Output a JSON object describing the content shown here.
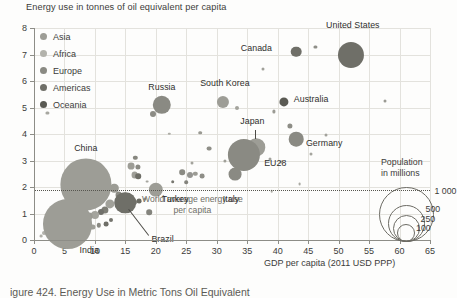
{
  "chart_data": {
    "type": "scatter",
    "title": "Energy use in tonnes of oil equivalent per capita",
    "xlabel": "GDP per capita (2011 USD PPP)",
    "ylabel": "Energy use in tonnes of oil equivalent per capita",
    "xlim": [
      0,
      65
    ],
    "ylim": [
      0,
      8
    ],
    "xticks": [
      "0",
      "5",
      "10",
      "15",
      "20",
      "25",
      "30",
      "35",
      "40",
      "45",
      "50",
      "55",
      "60",
      "65"
    ],
    "yticks": [
      "0",
      "1",
      "2",
      "3",
      "4",
      "5",
      "6",
      "7",
      "8"
    ],
    "grid": true,
    "legend_position": "top-left",
    "bubble_size_meaning": "Population in millions",
    "reference_line": {
      "value": 1.9,
      "label_line1": "World average energy use",
      "label_line2": "per capita",
      "style": "dotted"
    },
    "series": [
      {
        "name": "Asia",
        "color": "#9d9d96"
      },
      {
        "name": "Africa",
        "color": "#b3b3ac"
      },
      {
        "name": "Europe",
        "color": "#8a8a83"
      },
      {
        "name": "Americas",
        "color": "#6f6f68"
      },
      {
        "name": "Oceania",
        "color": "#5a5a53"
      }
    ],
    "size_legend": {
      "title_line1": "Population",
      "title_line2": "in millions",
      "entries": [
        "1 000",
        "500",
        "250",
        "100"
      ]
    },
    "annotated_points": [
      {
        "label": "United States",
        "x": 52,
        "y": 7.0,
        "pop": 320,
        "region": "Americas"
      },
      {
        "label": "Canada",
        "x": 43,
        "y": 7.1,
        "pop": 36,
        "region": "Americas"
      },
      {
        "label": "Russia",
        "x": 21,
        "y": 5.1,
        "pop": 144,
        "region": "Europe"
      },
      {
        "label": "South Korea",
        "x": 31,
        "y": 5.2,
        "pop": 51,
        "region": "Asia"
      },
      {
        "label": "Australia",
        "x": 41,
        "y": 5.2,
        "pop": 24,
        "region": "Oceania"
      },
      {
        "label": "Japan",
        "x": 36.5,
        "y": 3.5,
        "pop": 127,
        "region": "Asia"
      },
      {
        "label": "Germany",
        "x": 43,
        "y": 3.8,
        "pop": 82,
        "region": "Europe"
      },
      {
        "label": "EU28",
        "x": 34.5,
        "y": 3.2,
        "pop": 510,
        "region": "Europe"
      },
      {
        "label": "Italy",
        "x": 33,
        "y": 2.5,
        "pop": 60,
        "region": "Europe"
      },
      {
        "label": "China",
        "x": 8.5,
        "y": 2.1,
        "pop": 1380,
        "region": "Asia"
      },
      {
        "label": "India",
        "x": 5.5,
        "y": 0.6,
        "pop": 1310,
        "region": "Asia"
      },
      {
        "label": "Turkey",
        "x": 20,
        "y": 1.9,
        "pop": 79,
        "region": "Asia"
      },
      {
        "label": "Brazil",
        "x": 15,
        "y": 1.4,
        "pop": 208,
        "region": "Americas"
      }
    ],
    "other_points": [
      {
        "x": 2.2,
        "y": 4.8,
        "r": 1.6,
        "c": "#a7a7a0"
      },
      {
        "x": 27.3,
        "y": 4.05,
        "r": 1.8,
        "c": "#9a9a93"
      },
      {
        "x": 19.6,
        "y": 4.75,
        "r": 3.0,
        "c": "#8c8c85"
      },
      {
        "x": 22.2,
        "y": 4.0,
        "r": 1.2,
        "c": "#aeaea7"
      },
      {
        "x": 46.2,
        "y": 7.3,
        "r": 1.6,
        "c": "#8f8f88"
      },
      {
        "x": 37.6,
        "y": 6.45,
        "r": 1.5,
        "c": "#a0a099"
      },
      {
        "x": 57.6,
        "y": 5.25,
        "r": 1.5,
        "c": "#9a9a93"
      },
      {
        "x": 33.4,
        "y": 5.0,
        "r": 2.0,
        "c": "#a3a39c"
      },
      {
        "x": 39.4,
        "y": 4.85,
        "r": 1.6,
        "c": "#9b9b94"
      },
      {
        "x": 42.0,
        "y": 4.3,
        "r": 2.6,
        "c": "#8d8d86"
      },
      {
        "x": 48.0,
        "y": 3.95,
        "r": 1.5,
        "c": "#a2a29b"
      },
      {
        "x": 45.4,
        "y": 3.25,
        "r": 1.5,
        "c": "#a5a59e"
      },
      {
        "x": 40.6,
        "y": 2.95,
        "r": 1.4,
        "c": "#a8a8a1"
      },
      {
        "x": 38.7,
        "y": 3.05,
        "r": 1.5,
        "c": "#a2a29b"
      },
      {
        "x": 43.6,
        "y": 2.1,
        "r": 1.4,
        "c": "#aaaaa3"
      },
      {
        "x": 39.0,
        "y": 1.85,
        "r": 1.3,
        "c": "#acaca5"
      },
      {
        "x": 28.8,
        "y": 3.45,
        "r": 2.4,
        "c": "#8f8f88"
      },
      {
        "x": 31.4,
        "y": 3.0,
        "r": 1.6,
        "c": "#a0a099"
      },
      {
        "x": 26.0,
        "y": 2.9,
        "r": 1.5,
        "c": "#a3a39c"
      },
      {
        "x": 24.3,
        "y": 2.55,
        "r": 2.8,
        "c": "#8b8b84"
      },
      {
        "x": 25.6,
        "y": 2.45,
        "r": 3.0,
        "c": "#949490"
      },
      {
        "x": 26.5,
        "y": 2.5,
        "r": 2.2,
        "c": "#9b9b94"
      },
      {
        "x": 27.6,
        "y": 2.4,
        "r": 2.4,
        "c": "#8e8e87"
      },
      {
        "x": 22.8,
        "y": 2.2,
        "r": 1.8,
        "c": "#777770"
      },
      {
        "x": 25.0,
        "y": 2.18,
        "r": 1.8,
        "c": "#84847d"
      },
      {
        "x": 16.6,
        "y": 3.1,
        "r": 2.2,
        "c": "#87877f"
      },
      {
        "x": 16.0,
        "y": 2.8,
        "r": 3.4,
        "c": "#9d9d96"
      },
      {
        "x": 17.0,
        "y": 2.75,
        "r": 2.6,
        "c": "#8a8a83"
      },
      {
        "x": 16.5,
        "y": 2.45,
        "r": 3.4,
        "c": "#9e9e97"
      },
      {
        "x": 17.1,
        "y": 2.4,
        "r": 2.8,
        "c": "#6d6d66"
      },
      {
        "x": 18.6,
        "y": 2.2,
        "r": 1.4,
        "c": "#a6a69f"
      },
      {
        "x": 20.0,
        "y": 1.92,
        "r": 3.0,
        "c": "#76766f"
      },
      {
        "x": 18.2,
        "y": 1.55,
        "r": 1.6,
        "c": "#9a9a93"
      },
      {
        "x": 18.9,
        "y": 1.05,
        "r": 2.8,
        "c": "#84847d"
      },
      {
        "x": 14.8,
        "y": 1.62,
        "r": 3.6,
        "c": "#79796f"
      },
      {
        "x": 15.6,
        "y": 1.5,
        "r": 3.2,
        "c": "#6f6f66"
      },
      {
        "x": 16.4,
        "y": 1.45,
        "r": 3.0,
        "c": "#82827a"
      },
      {
        "x": 17.2,
        "y": 1.48,
        "r": 2.4,
        "c": "#6b6b63"
      },
      {
        "x": 13.9,
        "y": 1.7,
        "r": 3.4,
        "c": "#8b8b84"
      },
      {
        "x": 13.2,
        "y": 1.95,
        "r": 4.2,
        "c": "#9c9c95"
      },
      {
        "x": 12.4,
        "y": 1.35,
        "r": 4.6,
        "c": "#a1a19a"
      },
      {
        "x": 11.6,
        "y": 1.15,
        "r": 3.6,
        "c": "#7e7e76"
      },
      {
        "x": 11.0,
        "y": 1.05,
        "r": 3.0,
        "c": "#70706a"
      },
      {
        "x": 10.0,
        "y": 0.95,
        "r": 4.0,
        "c": "#a4a49d"
      },
      {
        "x": 9.0,
        "y": 0.9,
        "r": 3.4,
        "c": "#9a9a93"
      },
      {
        "x": 8.0,
        "y": 0.82,
        "r": 3.6,
        "c": "#a7a7a0"
      },
      {
        "x": 7.0,
        "y": 0.7,
        "r": 4.2,
        "c": "#ababa4"
      },
      {
        "x": 6.0,
        "y": 0.62,
        "r": 3.8,
        "c": "#a0a099"
      },
      {
        "x": 5.0,
        "y": 0.5,
        "r": 3.4,
        "c": "#acaca5"
      },
      {
        "x": 4.0,
        "y": 0.42,
        "r": 3.0,
        "c": "#a5a59e"
      },
      {
        "x": 3.2,
        "y": 0.38,
        "r": 2.6,
        "c": "#b0b0a9"
      },
      {
        "x": 2.4,
        "y": 0.32,
        "r": 2.2,
        "c": "#a9a9a2"
      },
      {
        "x": 1.7,
        "y": 0.28,
        "r": 2.0,
        "c": "#b2b2ab"
      },
      {
        "x": 9.6,
        "y": 0.48,
        "r": 2.6,
        "c": "#9f9f98"
      },
      {
        "x": 8.4,
        "y": 0.45,
        "r": 2.2,
        "c": "#aaaaa3"
      },
      {
        "x": 7.2,
        "y": 0.4,
        "r": 2.4,
        "c": "#a3a39c"
      },
      {
        "x": 6.2,
        "y": 0.35,
        "r": 2.0,
        "c": "#adada6"
      },
      {
        "x": 11.8,
        "y": 0.6,
        "r": 2.4,
        "c": "#6e6e67"
      },
      {
        "x": 12.6,
        "y": 0.75,
        "r": 2.0,
        "c": "#75756e"
      },
      {
        "x": 10.6,
        "y": 0.55,
        "r": 2.2,
        "c": "#8a8a83"
      },
      {
        "x": 4.6,
        "y": 0.22,
        "r": 1.6,
        "c": "#b4b4ad"
      },
      {
        "x": 2.9,
        "y": 0.18,
        "r": 1.4,
        "c": "#b6b6af"
      },
      {
        "x": 1.2,
        "y": 0.15,
        "r": 1.4,
        "c": "#b0b0a9"
      }
    ]
  },
  "caption": "igure 424. Energy Use in Metric Tons Oil Equivalent"
}
